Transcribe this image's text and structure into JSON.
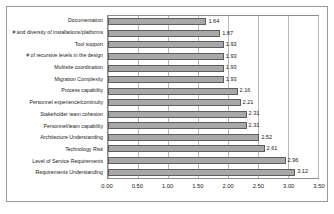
{
  "chart_data": {
    "type": "bar",
    "orientation": "horizontal",
    "title": "",
    "xlabel": "",
    "ylabel": "",
    "xlim": [
      0.0,
      3.5
    ],
    "xticks": [
      "0.00",
      "0.50",
      "1.00",
      "1.50",
      "2.00",
      "2.50",
      "3.00",
      "3.50"
    ],
    "xtick_values": [
      0.0,
      0.5,
      1.0,
      1.5,
      2.0,
      2.5,
      3.0,
      3.5
    ],
    "grid": true,
    "legend": false,
    "data_labels": true,
    "categories": [
      "Documentation",
      "# and diversity of installations/platforms",
      "Tool support",
      "# of recursive levels in the design",
      "Multisite coordination",
      "Migration Complexity",
      "Process capability",
      "Personnel experience/continuity",
      "Stakeholder team cohesion",
      "Personnel/team capability",
      "Architecture Understanding",
      "Technology Risk",
      "Level of Service Requirements",
      "Requirements Understanding"
    ],
    "values": [
      1.64,
      1.87,
      1.93,
      1.93,
      1.93,
      1.93,
      2.16,
      2.21,
      2.31,
      2.31,
      2.52,
      2.61,
      2.96,
      3.12
    ],
    "value_labels": [
      "1.64",
      "1.87",
      "1.93",
      "1.93",
      "1.93",
      "1.93",
      "2.16",
      "2.21",
      "2.31",
      "2.31",
      "2.52",
      "2.61",
      "2.96",
      "3.12"
    ],
    "colors": {
      "bar_fill": "#a8a8a8",
      "bar_border": "#5d5d5d",
      "gridline": "#b8b8b8",
      "plot_border": "#8c8c8c",
      "frame_border": "#9a9a9a",
      "background": "#ffffff",
      "text": "#1a1a1a"
    }
  }
}
